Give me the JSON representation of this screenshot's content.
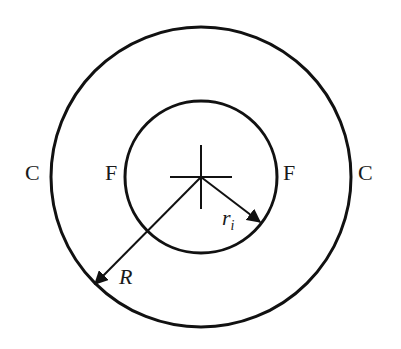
{
  "diagram": {
    "type": "concentric-circles",
    "stroke_color": "#111111",
    "background": "#ffffff",
    "outer_circle": {
      "label_left": "C",
      "label_right": "C",
      "radius_label": "R"
    },
    "inner_circle": {
      "label_left": "F",
      "label_right": "F",
      "radius_label_main": "r",
      "radius_label_sub": "i"
    },
    "center_mark": "crosshair"
  }
}
